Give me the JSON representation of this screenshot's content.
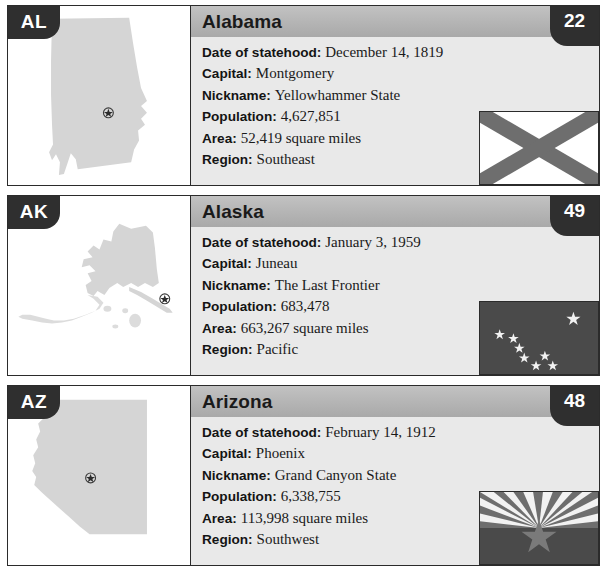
{
  "page": {
    "colors": {
      "page_background": "#ffffff",
      "card_border": "#2b2b2b",
      "badge_dark": "#2f2f2f",
      "header_gray": "#b4b4b4",
      "info_background": "#e9e9e9",
      "map_fill": "#d5d5d5",
      "flag_gray": "#6e6e6e",
      "flag_dark": "#4a4a4a"
    },
    "fact_labels": {
      "statehood": "Date of statehood:",
      "capital": "Capital:",
      "nickname": "Nickname:",
      "population": "Population:",
      "area": "Area:",
      "region": "Region:"
    }
  },
  "cards": [
    {
      "abbr": "AL",
      "name": "Alabama",
      "rank": "22",
      "statehood": "December 14, 1819",
      "capital": "Montgomery",
      "nickname": "Yellowhammer State",
      "population": "4,627,851",
      "area": "52,419 square miles",
      "region": "Southeast",
      "map_icon": "alabama-map-outline",
      "flag_icon": "alabama-flag",
      "capital_marker_icon": "capital-star-marker"
    },
    {
      "abbr": "AK",
      "name": "Alaska",
      "rank": "49",
      "statehood": "January 3, 1959",
      "capital": "Juneau",
      "nickname": "The Last Frontier",
      "population": "683,478",
      "area": "663,267 square miles",
      "region": "Pacific",
      "map_icon": "alaska-map-outline",
      "flag_icon": "alaska-flag",
      "capital_marker_icon": "capital-star-marker"
    },
    {
      "abbr": "AZ",
      "name": "Arizona",
      "rank": "48",
      "statehood": "February 14, 1912",
      "capital": "Phoenix",
      "nickname": "Grand Canyon State",
      "population": "6,338,755",
      "area": "113,998 square miles",
      "region": "Southwest",
      "map_icon": "arizona-map-outline",
      "flag_icon": "arizona-flag",
      "capital_marker_icon": "capital-star-marker"
    }
  ]
}
